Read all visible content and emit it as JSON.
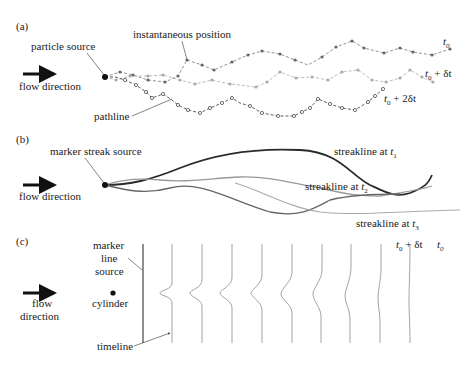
{
  "panel_a": {
    "label": "(a)",
    "particle_source": "particle source",
    "instantaneous_position": "instantaneous position",
    "flow_direction": "flow direction",
    "pathline": "pathline",
    "t0": "t",
    "t0_sub": "0",
    "t0_dt": "t",
    "t0_dt_sub": "0",
    "t0_dt_suffix": " + δt",
    "t0_2dt": "t",
    "t0_2dt_sub": "0",
    "t0_2dt_suffix": " + 2δt"
  },
  "panel_b": {
    "label": "(b)",
    "marker_streak_source": "marker streak source",
    "flow_direction": "flow direction",
    "streak1": "streakline at ",
    "streak1_t": "t",
    "streak1_sub": "1",
    "streak2": "streakline at ",
    "streak2_t": "t",
    "streak2_sub": "2",
    "streak3": "streakline at ",
    "streak3_t": "t",
    "streak3_sub": "3"
  },
  "panel_c": {
    "label": "(c)",
    "marker": "marker",
    "line": "line",
    "source": "source",
    "flow": "flow",
    "direction": "direction",
    "cylinder": "cylinder",
    "timeline": "timeline",
    "t0_dt": "t",
    "t0_dt_sub": "0",
    "t0_dt_suffix": " + δt",
    "t0": "t",
    "t0_sub": "0"
  },
  "colors": {
    "dark": "#2a2a2a",
    "mid": "#777777",
    "light": "#aaaaaa",
    "vlight": "#bbbbbb"
  }
}
